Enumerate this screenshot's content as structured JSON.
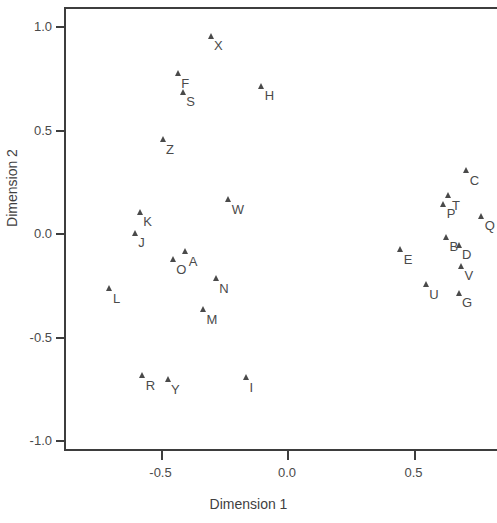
{
  "chart_data": {
    "type": "scatter",
    "title": "",
    "xlabel": "Dimension 1",
    "ylabel": "Dimension 2",
    "xlim": [
      -0.88,
      0.83
    ],
    "ylim": [
      -1.14,
      1.09
    ],
    "grid": false,
    "legend": null,
    "marker": "filled-triangle",
    "marker_color": "#4a4a4a",
    "xticks": [
      -0.5,
      0.0,
      0.5
    ],
    "xticklabels": [
      "-0.5",
      "0.0",
      "0.5"
    ],
    "yticks": [
      1.0,
      0.5,
      0.0,
      -0.5,
      -1.0
    ],
    "yticklabels": [
      "1.0",
      "0.5",
      "0.0",
      "-0.5",
      "-1.0"
    ],
    "point_labels": [
      "X",
      "F",
      "S",
      "H",
      "Z",
      "W",
      "K",
      "J",
      "A",
      "O",
      "N",
      "L",
      "M",
      "R",
      "Y",
      "I",
      "C",
      "T",
      "P",
      "Q",
      "B",
      "D",
      "E",
      "V",
      "U",
      "G"
    ],
    "x": [
      -0.3,
      -0.43,
      -0.41,
      -0.1,
      -0.49,
      -0.23,
      -0.58,
      -0.6,
      -0.4,
      -0.45,
      -0.28,
      -0.7,
      -0.33,
      -0.57,
      -0.47,
      -0.16,
      0.71,
      0.64,
      0.62,
      0.77,
      0.63,
      0.68,
      0.45,
      0.69,
      0.55,
      0.68
    ],
    "y": [
      0.95,
      0.77,
      0.68,
      0.71,
      0.45,
      0.16,
      0.1,
      0.0,
      -0.09,
      -0.13,
      -0.22,
      -0.27,
      -0.37,
      -0.69,
      -0.71,
      -0.7,
      0.3,
      0.18,
      0.14,
      0.08,
      -0.02,
      -0.06,
      -0.08,
      -0.16,
      -0.25,
      -0.29
    ],
    "points": [
      {
        "label": "X",
        "x": -0.3,
        "y": 0.95
      },
      {
        "label": "F",
        "x": -0.43,
        "y": 0.77
      },
      {
        "label": "S",
        "x": -0.41,
        "y": 0.68
      },
      {
        "label": "H",
        "x": -0.1,
        "y": 0.71
      },
      {
        "label": "Z",
        "x": -0.49,
        "y": 0.45
      },
      {
        "label": "W",
        "x": -0.23,
        "y": 0.16
      },
      {
        "label": "K",
        "x": -0.58,
        "y": 0.1
      },
      {
        "label": "J",
        "x": -0.6,
        "y": 0.0
      },
      {
        "label": "A",
        "x": -0.4,
        "y": -0.09
      },
      {
        "label": "O",
        "x": -0.45,
        "y": -0.13
      },
      {
        "label": "N",
        "x": -0.28,
        "y": -0.22
      },
      {
        "label": "L",
        "x": -0.7,
        "y": -0.27
      },
      {
        "label": "M",
        "x": -0.33,
        "y": -0.37
      },
      {
        "label": "R",
        "x": -0.57,
        "y": -0.69
      },
      {
        "label": "Y",
        "x": -0.47,
        "y": -0.71
      },
      {
        "label": "I",
        "x": -0.16,
        "y": -0.7
      },
      {
        "label": "C",
        "x": 0.71,
        "y": 0.3
      },
      {
        "label": "T",
        "x": 0.64,
        "y": 0.18
      },
      {
        "label": "P",
        "x": 0.62,
        "y": 0.14
      },
      {
        "label": "Q",
        "x": 0.77,
        "y": 0.08
      },
      {
        "label": "B",
        "x": 0.63,
        "y": -0.02
      },
      {
        "label": "D",
        "x": 0.68,
        "y": -0.06
      },
      {
        "label": "E",
        "x": 0.45,
        "y": -0.08
      },
      {
        "label": "V",
        "x": 0.69,
        "y": -0.16
      },
      {
        "label": "U",
        "x": 0.55,
        "y": -0.25
      },
      {
        "label": "G",
        "x": 0.68,
        "y": -0.29
      }
    ]
  }
}
